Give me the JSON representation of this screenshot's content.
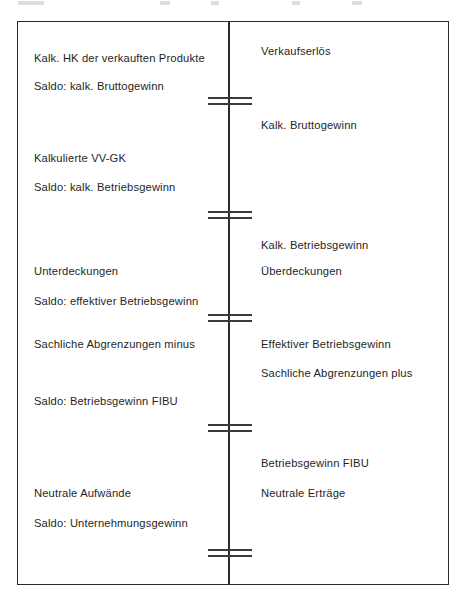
{
  "figure": {
    "kind": "t-account-diagram",
    "title_visible": false,
    "frame": {
      "border_color": "#2b2b2b"
    },
    "divider": {
      "name": "center-vertical-divider",
      "color": "#2b2b2b"
    }
  },
  "left_column": {
    "name": "debit-side",
    "entries": [
      {
        "label": "Kalk. HK der verkauften Produkte",
        "top": 52
      },
      {
        "label": "Saldo: kalk. Bruttogewinn",
        "top": 80
      },
      {
        "label": "Kalkulierte VV-GK",
        "top": 152
      },
      {
        "label": "Saldo: kalk. Betriebsgewinn",
        "top": 181
      },
      {
        "label": "Unterdeckungen",
        "top": 265
      },
      {
        "label": "Saldo: effektiver Betriebsgewinn",
        "top": 295
      },
      {
        "label": "Sachliche Abgrenzungen minus",
        "top": 338
      },
      {
        "label": "Saldo: Betriebsgewinn FIBU",
        "top": 395
      },
      {
        "label": "Neutrale Aufwände",
        "top": 487
      },
      {
        "label": "Saldo: Unternehmungsgewinn",
        "top": 517
      }
    ]
  },
  "right_column": {
    "name": "credit-side",
    "entries": [
      {
        "label": "Verkaufserlös",
        "top": 45
      },
      {
        "label": "Kalk. Bruttogewinn",
        "top": 119
      },
      {
        "label": "Kalk. Betriebsgewinn",
        "top": 239
      },
      {
        "label": "Überdeckungen",
        "top": 265
      },
      {
        "label": "Effektiver Betriebsgewinn",
        "top": 338
      },
      {
        "label": "Sachliche Abgrenzungen plus",
        "top": 367
      },
      {
        "label": "Betriebsgewinn FIBU",
        "top": 457
      },
      {
        "label": "Neutrale Erträge",
        "top": 487
      }
    ]
  },
  "separators": [
    {
      "name": "balance-rule-1",
      "top": 97
    },
    {
      "name": "balance-rule-2",
      "top": 211
    },
    {
      "name": "balance-rule-3",
      "top": 314
    },
    {
      "name": "balance-rule-4",
      "top": 424
    },
    {
      "name": "balance-rule-5",
      "top": 549
    }
  ]
}
